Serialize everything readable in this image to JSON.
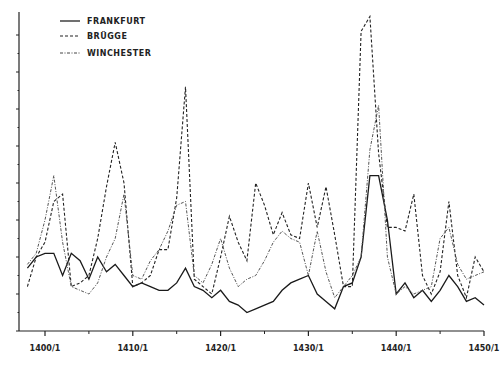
{
  "chart_data": {
    "type": "line",
    "title": "",
    "xlabel": "",
    "ylabel": "",
    "x_tick_labels": [
      "1400/1",
      "1410/1",
      "1420/1",
      "1430/1",
      "1440/1",
      "1450/1"
    ],
    "x_ticks": [
      1400,
      1410,
      1420,
      1430,
      1440,
      1450
    ],
    "xlim": [
      1398,
      1450
    ],
    "ylim": [
      0,
      8.5
    ],
    "y_tick_count": 8,
    "y_tick_labels": [],
    "grid": false,
    "legend_position": "top-left",
    "x": [
      1398,
      1399,
      1400,
      1401,
      1402,
      1403,
      1404,
      1405,
      1406,
      1407,
      1408,
      1409,
      1410,
      1411,
      1412,
      1413,
      1414,
      1415,
      1416,
      1417,
      1418,
      1419,
      1420,
      1421,
      1422,
      1423,
      1424,
      1425,
      1426,
      1427,
      1428,
      1429,
      1430,
      1431,
      1432,
      1433,
      1434,
      1435,
      1436,
      1437,
      1438,
      1439,
      1440,
      1441,
      1442,
      1443,
      1444,
      1445,
      1446,
      1447,
      1448,
      1449,
      1450
    ],
    "series": [
      {
        "name": "FRANKFURT",
        "style": "solid",
        "values": [
          1.7,
          2.0,
          2.1,
          2.1,
          1.5,
          2.1,
          1.9,
          1.4,
          2.0,
          1.6,
          1.8,
          1.5,
          1.2,
          1.3,
          1.2,
          1.1,
          1.1,
          1.3,
          1.7,
          1.2,
          1.1,
          0.9,
          1.1,
          0.8,
          0.7,
          0.5,
          0.6,
          0.7,
          0.8,
          1.1,
          1.3,
          1.4,
          1.5,
          1.0,
          0.8,
          0.6,
          1.2,
          1.3,
          2.0,
          4.2,
          4.2,
          3.0,
          1.0,
          1.3,
          0.9,
          1.1,
          0.8,
          1.1,
          1.5,
          1.2,
          0.8,
          0.9,
          0.7
        ]
      },
      {
        "name": "BRÜGGE",
        "style": "dashed",
        "values": [
          1.2,
          2.0,
          2.4,
          3.5,
          3.7,
          1.2,
          1.3,
          1.5,
          2.5,
          3.9,
          5.1,
          4.0,
          1.2,
          1.3,
          1.5,
          2.2,
          2.2,
          3.6,
          6.6,
          1.4,
          1.2,
          1.0,
          2.0,
          3.1,
          2.4,
          1.9,
          4.0,
          3.4,
          2.6,
          3.2,
          2.6,
          2.5,
          4.0,
          2.8,
          3.9,
          2.6,
          1.2,
          1.2,
          8.1,
          8.5,
          4.8,
          2.8,
          2.8,
          2.7,
          3.7,
          1.5,
          1.0,
          1.6,
          3.5,
          1.5,
          0.9,
          2.0,
          1.6
        ]
      },
      {
        "name": "WINCHESTER",
        "style": "dash-dot",
        "values": [
          1.8,
          2.1,
          3.0,
          4.2,
          2.4,
          1.2,
          1.1,
          1.0,
          1.3,
          2.0,
          2.5,
          3.7,
          1.5,
          1.4,
          1.9,
          2.2,
          2.7,
          3.4,
          3.5,
          1.5,
          1.3,
          1.8,
          2.5,
          1.7,
          1.2,
          1.4,
          1.5,
          1.9,
          2.4,
          2.7,
          2.5,
          2.4,
          1.5,
          2.7,
          1.6,
          0.9,
          1.2,
          1.5,
          2.0,
          4.9,
          6.1,
          2.0,
          1.0,
          1.2,
          1.0,
          1.1,
          1.2,
          2.5,
          2.8,
          1.8,
          1.4,
          1.5,
          1.6
        ]
      }
    ]
  }
}
